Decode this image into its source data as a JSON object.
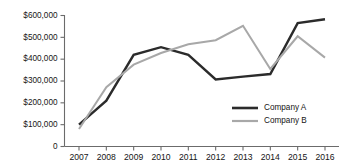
{
  "chart_data": {
    "type": "line",
    "title": "",
    "xlabel": "",
    "ylabel": "",
    "categories": [
      "2007",
      "2008",
      "2009",
      "2010",
      "2011",
      "2012",
      "2013",
      "2014",
      "2015",
      "2016"
    ],
    "series": [
      {
        "name": "Company A",
        "color": "#2b2b2b",
        "values": [
          100000,
          210000,
          420000,
          455000,
          420000,
          307000,
          320000,
          332000,
          565000,
          583000
        ]
      },
      {
        "name": "Company B",
        "color": "#a8a8a8",
        "values": [
          80000,
          272000,
          375000,
          428000,
          468000,
          487000,
          553000,
          355000,
          505000,
          407000
        ]
      }
    ],
    "ylim": [
      0,
      600000
    ],
    "yticks": [
      0,
      100000,
      200000,
      300000,
      400000,
      500000,
      600000
    ],
    "ytick_labels": [
      "0",
      "$100,000",
      "$200,000",
      "$300,000",
      "$400,000",
      "$500,000",
      "$600,000"
    ],
    "grid": false,
    "legend_position": "inside-right-lower",
    "axis_color": "#6b6b6b"
  },
  "legend": {
    "entries": [
      {
        "label": "Company A"
      },
      {
        "label": "Company B"
      }
    ]
  }
}
